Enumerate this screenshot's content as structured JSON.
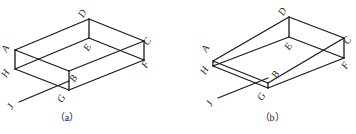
{
  "figure": {
    "width": 356,
    "height": 134,
    "background": "#ffffff",
    "line_color": "#1a1a1a",
    "text_color": "#222222"
  },
  "panels": [
    {
      "id": "a",
      "caption": "（a）",
      "caption_pos": [
        67,
        121
      ],
      "points": {
        "A": [
          15,
          50
        ],
        "B": [
          69,
          71
        ],
        "C": [
          144,
          41
        ],
        "D": [
          89,
          19
        ],
        "E": [
          89,
          38
        ],
        "F": [
          144,
          60
        ],
        "G": [
          69,
          90
        ],
        "H": [
          15,
          69
        ],
        "J": [
          19,
          102
        ],
        "Jend": [
          69,
          81
        ]
      },
      "edges": [
        [
          "A",
          "D"
        ],
        [
          "D",
          "C"
        ],
        [
          "C",
          "B"
        ],
        [
          "B",
          "A"
        ],
        [
          "A",
          "H"
        ],
        [
          "B",
          "G"
        ],
        [
          "C",
          "F"
        ],
        [
          "D",
          "E"
        ],
        [
          "H",
          "E"
        ],
        [
          "E",
          "F"
        ],
        [
          "H",
          "G"
        ],
        [
          "G",
          "F"
        ],
        [
          "J",
          "Jend"
        ]
      ],
      "labels": [
        {
          "text": "A",
          "x": 8,
          "y": 50,
          "rotate": -60
        },
        {
          "text": "B",
          "x": 76,
          "y": 80,
          "rotate": -60
        },
        {
          "text": "C",
          "x": 150,
          "y": 43,
          "rotate": -60
        },
        {
          "text": "D",
          "x": 85,
          "y": 15,
          "rotate": -60
        },
        {
          "text": "E",
          "x": 90,
          "y": 49,
          "rotate": -60
        },
        {
          "text": "F",
          "x": 148,
          "y": 66,
          "rotate": -60
        },
        {
          "text": "G",
          "x": 64,
          "y": 100,
          "rotate": -60
        },
        {
          "text": "H",
          "x": 8,
          "y": 75,
          "rotate": -60
        },
        {
          "text": "J",
          "x": 13,
          "y": 108,
          "rotate": -60
        }
      ]
    },
    {
      "id": "b",
      "caption": "（b）",
      "caption_pos": [
        272,
        121
      ],
      "points": {
        "A": [
          213,
          61
        ],
        "B": [
          268,
          83
        ],
        "C": [
          344,
          38
        ],
        "D": [
          289,
          17
        ],
        "E": [
          289,
          37
        ],
        "F": [
          344,
          58
        ],
        "G": [
          268,
          88
        ],
        "H": [
          213,
          66
        ],
        "J": [
          218,
          98
        ],
        "Jend": [
          268,
          78
        ]
      },
      "edges": [
        [
          "A",
          "D"
        ],
        [
          "D",
          "C"
        ],
        [
          "C",
          "B"
        ],
        [
          "B",
          "A"
        ],
        [
          "A",
          "H"
        ],
        [
          "B",
          "G"
        ],
        [
          "C",
          "F"
        ],
        [
          "D",
          "E"
        ],
        [
          "H",
          "E"
        ],
        [
          "E",
          "F"
        ],
        [
          "H",
          "G"
        ],
        [
          "G",
          "F"
        ],
        [
          "J",
          "Jend"
        ]
      ],
      "labels": [
        {
          "text": "A",
          "x": 208,
          "y": 50,
          "rotate": -60
        },
        {
          "text": "B",
          "x": 278,
          "y": 76,
          "rotate": -60
        },
        {
          "text": "C",
          "x": 350,
          "y": 42,
          "rotate": -60
        },
        {
          "text": "D",
          "x": 285,
          "y": 13,
          "rotate": -60
        },
        {
          "text": "E",
          "x": 291,
          "y": 48,
          "rotate": -60
        },
        {
          "text": "F",
          "x": 348,
          "y": 67,
          "rotate": -60
        },
        {
          "text": "G",
          "x": 264,
          "y": 98,
          "rotate": -60
        },
        {
          "text": "H",
          "x": 207,
          "y": 72,
          "rotate": -60
        },
        {
          "text": "J",
          "x": 212,
          "y": 105,
          "rotate": -60
        }
      ]
    }
  ]
}
